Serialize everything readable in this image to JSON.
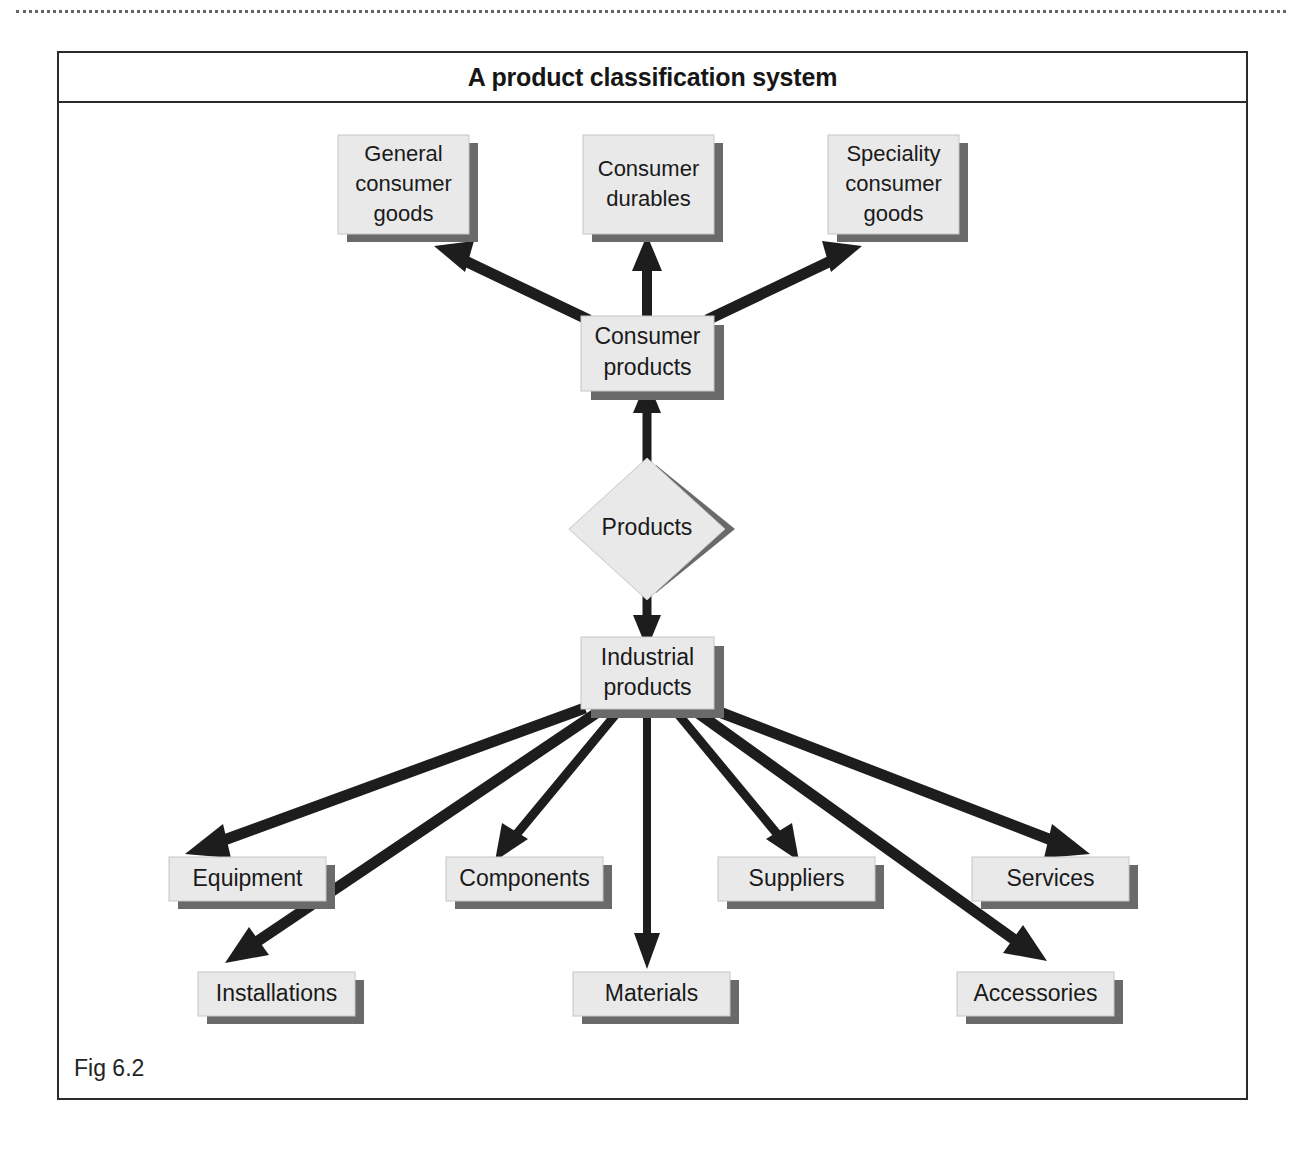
{
  "figure": {
    "title": "A product classification system",
    "fig_label": "Fig 6.2",
    "colors": {
      "box_fill": "#e9e9e9",
      "box_shadow": "#6a6a6a",
      "arrow": "#1d1d1d",
      "frame": "#2b2b2b",
      "text": "#1a1a1a"
    }
  },
  "nodes": {
    "root": {
      "label": "Products",
      "shape": "diamond"
    },
    "consumer_products": {
      "label_line1": "Consumer",
      "label_line2": "products",
      "shape": "rect"
    },
    "industrial_products": {
      "label_line1": "Industrial",
      "label_line2": "products",
      "shape": "rect"
    },
    "consumer_children": [
      {
        "label_line1": "General",
        "label_line2": "consumer",
        "label_line3": "goods"
      },
      {
        "label_line1": "Consumer",
        "label_line2": "durables",
        "label_line3": ""
      },
      {
        "label_line1": "Speciality",
        "label_line2": "consumer",
        "label_line3": "goods"
      }
    ],
    "industrial_children_upper": [
      {
        "label": "Equipment"
      },
      {
        "label": "Components"
      },
      {
        "label": "Suppliers"
      },
      {
        "label": "Services"
      }
    ],
    "industrial_children_lower": [
      {
        "label": "Installations"
      },
      {
        "label": "Materials"
      },
      {
        "label": "Accessories"
      }
    ]
  },
  "edges": {
    "root_to_consumer": "Products -> Consumer products",
    "root_to_industrial": "Products -> Industrial products",
    "consumer_to_children": [
      "Consumer products -> General consumer goods",
      "Consumer products -> Consumer durables",
      "Consumer products -> Speciality consumer goods"
    ],
    "industrial_to_children": [
      "Industrial products -> Equipment",
      "Industrial products -> Installations",
      "Industrial products -> Components",
      "Industrial products -> Materials",
      "Industrial products -> Suppliers",
      "Industrial products -> Accessories",
      "Industrial products -> Services"
    ]
  }
}
